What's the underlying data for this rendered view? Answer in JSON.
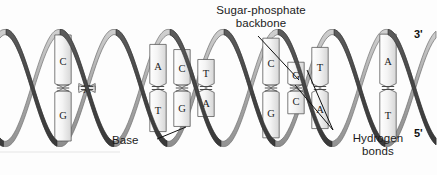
{
  "figure": {
    "background_color": "#fdfdfd"
  },
  "colors": {
    "front_ribbon": "#4a4a4a",
    "back_ribbon": "#9b9b9b",
    "back_ribbon_highlight": "#c9c9c9",
    "base_fill": "#f2f2f2",
    "base_fill_shadow": "#d8d8d8",
    "base_outline": "#5a5a5a",
    "hydrogen_bond": "#3a3a3a",
    "label_text": "#1b1b1b",
    "leader_line": "#111111"
  },
  "annotations": {
    "sugar_phosphate_backbone": "Sugar-phosphate\nbackbone",
    "base": "Base",
    "hydrogen_bonds": "Hydrogen\nbonds"
  },
  "end_labels": {
    "three_prime": "3'",
    "five_prime": "5'"
  },
  "base_pairs": [
    {
      "id": "bp1",
      "x": 63,
      "top_base": "C",
      "bottom_base": "G",
      "bond_count": 3
    },
    {
      "id": "bp2",
      "x": 87,
      "top_base": "A",
      "bottom_base": "T",
      "bond_count": 2
    },
    {
      "id": "bp3",
      "x": 158,
      "top_base": "A",
      "bottom_base": "T",
      "bond_count": 2
    },
    {
      "id": "bp4",
      "x": 182,
      "top_base": "C",
      "bottom_base": "G",
      "bond_count": 3
    },
    {
      "id": "bp5",
      "x": 206,
      "top_base": "T",
      "bottom_base": "A",
      "bond_count": 2
    },
    {
      "id": "bp6",
      "x": 271,
      "top_base": "C",
      "bottom_base": "G",
      "bond_count": 3
    },
    {
      "id": "bp7",
      "x": 296,
      "top_base": "G",
      "bottom_base": "C",
      "bond_count": 3
    },
    {
      "id": "bp8",
      "x": 320,
      "top_base": "T",
      "bottom_base": "A",
      "bond_count": 2
    },
    {
      "id": "bp9",
      "x": 388,
      "top_base": "A",
      "bottom_base": "T",
      "bond_count": 2
    }
  ],
  "helix": {
    "turns": 4,
    "period_px": 109,
    "amplitude_px": 56,
    "center_y": 88,
    "ribbon_width_px": 11,
    "strand_count": 2
  },
  "leader_lines": [
    {
      "name": "backbone-leader",
      "x1": 258,
      "y1": 36,
      "x2": 299,
      "y2": 80
    },
    {
      "name": "base-leader",
      "x1": 157,
      "y1": 139,
      "x2": 186,
      "y2": 127
    },
    {
      "name": "hbond-leader-a",
      "x1": 333,
      "y1": 130,
      "x2": 295,
      "y2": 85
    },
    {
      "name": "hbond-leader-b",
      "x1": 333,
      "y1": 130,
      "x2": 307,
      "y2": 70
    }
  ]
}
